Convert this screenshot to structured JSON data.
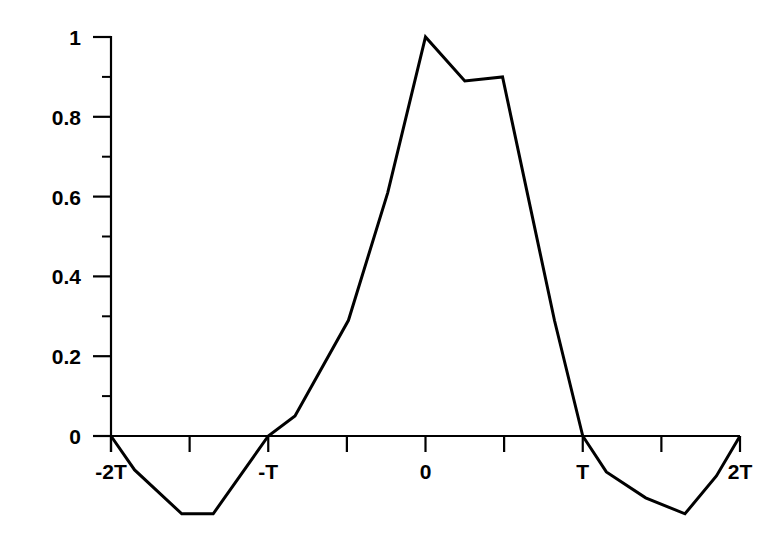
{
  "chart_data": {
    "type": "line",
    "title": "",
    "subtitle": "",
    "xlabel": "",
    "ylabel": "",
    "xlim": [
      -2,
      2
    ],
    "ylim": [
      -0.2,
      1
    ],
    "grid": false,
    "legend": null,
    "x_unit": "T",
    "x_tick_positions": [
      -2,
      -1.5,
      -1,
      -0.5,
      0,
      0.5,
      1,
      1.5,
      2
    ],
    "x_tick_labels": [
      "-2T",
      "",
      "-T",
      "",
      "0",
      "",
      "T",
      "",
      "2T"
    ],
    "x_major_labels": [
      {
        "value": -2,
        "label": "-2T"
      },
      {
        "value": -1,
        "label": "-T"
      },
      {
        "value": 0,
        "label": "0"
      },
      {
        "value": 1,
        "label": "T"
      },
      {
        "value": 2,
        "label": "2T"
      }
    ],
    "y_tick_positions": [
      0,
      0.1,
      0.2,
      0.3,
      0.4,
      0.5,
      0.6,
      0.7,
      0.8,
      0.9,
      1
    ],
    "y_major_ticks": [
      0,
      0.2,
      0.4,
      0.6,
      0.8,
      1
    ],
    "y_major_labels": [
      "0",
      "0.2",
      "0.4",
      "0.6",
      "0.8",
      "1"
    ],
    "y_minor_ticks": [
      0.1,
      0.3,
      0.5,
      0.7,
      0.9
    ],
    "series": [
      {
        "name": "pulse",
        "color": "#000000",
        "x": [
          -2.0,
          -1.85,
          -1.55,
          -1.35,
          -1.0,
          -0.83,
          -0.49,
          -0.24,
          0.0,
          0.25,
          0.49,
          0.82,
          1.0,
          1.15,
          1.4,
          1.65,
          1.85,
          2.0
        ],
        "y": [
          0.0,
          -0.085,
          -0.195,
          -0.195,
          0.0,
          0.05,
          0.29,
          0.61,
          1.0,
          0.89,
          0.9,
          0.29,
          0.0,
          -0.09,
          -0.155,
          -0.195,
          -0.1,
          0.0
        ]
      }
    ],
    "annotations": []
  },
  "axes": {
    "y_axis_name": "y-axis",
    "x_axis_name": "x-axis"
  },
  "colors": {
    "background": "#ffffff",
    "foreground": "#000000",
    "curve": "#000000"
  }
}
